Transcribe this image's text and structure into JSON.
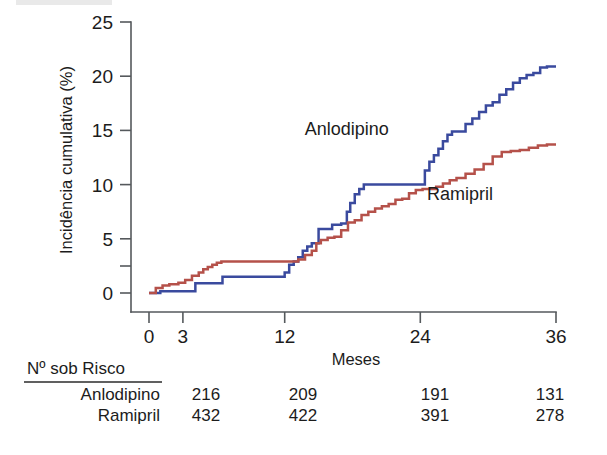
{
  "chart_data": {
    "type": "line",
    "title": "",
    "subtitle": "",
    "xlabel": "Meses",
    "ylabel": "Incidência cumulativa (%)",
    "xlim": [
      0,
      36
    ],
    "ylim": [
      0,
      25
    ],
    "xticks": [
      0,
      3,
      12,
      24,
      36
    ],
    "xtick_labels": [
      "0",
      "3",
      "12",
      "24",
      "36"
    ],
    "yticks": [
      0,
      5,
      10,
      15,
      20,
      25
    ],
    "ytick_labels": [
      "0",
      "5",
      "10",
      "15",
      "20",
      "25"
    ],
    "minor_yticks": [
      2.5
    ],
    "grid": false,
    "legend_position": "inline-annotations",
    "step_style": "post",
    "series": [
      {
        "name": "Anlodipino",
        "color": "#3a4a9e",
        "annotation": "Anlodipino",
        "annotation_at": [
          17.5,
          14.6
        ],
        "x": [
          0.0,
          1.0,
          3.6,
          4.1,
          6.0,
          6.5,
          7.0,
          11.6,
          12.0,
          12.4,
          12.8,
          13.2,
          13.6,
          14.0,
          14.4,
          15.0,
          15.6,
          16.2,
          17.0,
          17.5,
          17.8,
          18.2,
          18.6,
          19.0,
          19.4,
          19.8,
          24.0,
          24.4,
          24.8,
          25.2,
          25.6,
          26.0,
          26.4,
          26.8,
          27.4,
          28.0,
          28.6,
          29.2,
          29.8,
          30.4,
          31.0,
          31.6,
          32.2,
          32.8,
          33.4,
          34.0,
          34.6,
          35.2,
          36.0
        ],
        "y": [
          0.0,
          0.15,
          0.15,
          0.9,
          0.9,
          1.5,
          1.5,
          1.5,
          1.9,
          2.6,
          2.9,
          3.3,
          3.9,
          4.3,
          4.6,
          5.9,
          5.9,
          6.3,
          6.4,
          7.5,
          8.3,
          9.1,
          9.6,
          10.0,
          10.0,
          10.0,
          10.0,
          11.3,
          12.1,
          12.7,
          13.3,
          14.0,
          14.6,
          14.9,
          14.9,
          15.6,
          16.1,
          16.7,
          17.3,
          17.6,
          18.3,
          18.8,
          19.4,
          19.8,
          20.1,
          20.3,
          20.8,
          20.9,
          20.9
        ]
      },
      {
        "name": "Ramipril",
        "color": "#b5514a",
        "annotation": "Ramipril",
        "annotation_at": [
          27.5,
          8.6
        ],
        "x": [
          0.0,
          0.6,
          1.2,
          1.8,
          2.6,
          3.2,
          3.8,
          4.4,
          4.8,
          5.2,
          5.6,
          6.0,
          6.4,
          6.9,
          12.6,
          13.2,
          13.8,
          14.4,
          14.8,
          15.2,
          15.8,
          16.4,
          17.0,
          17.6,
          18.2,
          18.8,
          19.4,
          20.0,
          20.6,
          21.2,
          21.8,
          22.4,
          23.0,
          23.6,
          24.2,
          24.8,
          25.4,
          26.0,
          26.6,
          27.2,
          28.0,
          28.8,
          29.6,
          30.4,
          31.2,
          32.0,
          32.8,
          33.6,
          34.4,
          35.2,
          36.0
        ],
        "y": [
          0.0,
          0.45,
          0.7,
          0.8,
          0.95,
          1.2,
          1.6,
          1.9,
          2.2,
          2.4,
          2.6,
          2.8,
          2.9,
          2.9,
          2.9,
          3.1,
          3.5,
          3.9,
          4.6,
          4.9,
          5.1,
          5.2,
          5.8,
          6.5,
          6.7,
          7.2,
          7.5,
          7.8,
          8.0,
          8.2,
          8.6,
          8.7,
          9.2,
          9.5,
          9.6,
          9.6,
          9.8,
          10.1,
          10.4,
          10.6,
          11.0,
          11.4,
          11.9,
          12.6,
          13.0,
          13.1,
          13.2,
          13.4,
          13.6,
          13.7,
          13.7
        ]
      }
    ]
  },
  "risk_table": {
    "header": "Nº sob Risco",
    "columns_at_months": [
      0,
      12,
      24,
      36
    ],
    "rows": [
      {
        "label": "Anlodipino",
        "values": [
          "216",
          "209",
          "191",
          "131"
        ]
      },
      {
        "label": "Ramipril",
        "values": [
          "432",
          "422",
          "391",
          "278"
        ]
      }
    ]
  },
  "colors": {
    "anlodipino": "#3a4a9e",
    "ramipril": "#b5514a",
    "axis": "#55595c",
    "text": "#1c1c1c",
    "background": "#ffffff"
  }
}
